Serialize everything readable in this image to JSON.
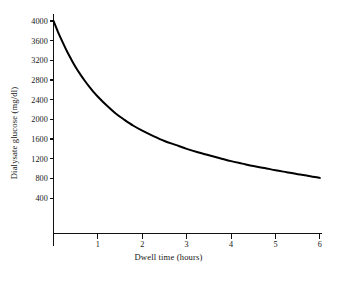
{
  "chart_data": {
    "type": "line",
    "title": "",
    "subtitle": "",
    "xlabel": "Dwell time (hours)",
    "ylabel": "Dialysate glucose (mg/dl)",
    "xlim": [
      0,
      6
    ],
    "ylim": [
      0,
      4100
    ],
    "xticks": [
      1,
      2,
      3,
      4,
      5,
      6
    ],
    "xtick_labels": [
      "1",
      "2",
      "3",
      "4",
      "5",
      "6"
    ],
    "yticks": [
      400,
      800,
      1200,
      1600,
      2000,
      2400,
      2800,
      3200,
      3600,
      4000
    ],
    "ytick_labels": [
      "400",
      "800",
      "1200",
      "1600",
      "2000",
      "2400",
      "2800",
      "3200",
      "3600",
      "4000"
    ],
    "grid": false,
    "legend": null,
    "annotations": [],
    "series": [
      {
        "name": "Dialysate glucose",
        "color": "#000000",
        "x": [
          0,
          0.1,
          0.2,
          0.3,
          0.4,
          0.5,
          0.6,
          0.7,
          0.8,
          0.9,
          1.0,
          1.2,
          1.4,
          1.6,
          1.8,
          2.0,
          2.25,
          2.5,
          2.75,
          3.0,
          3.25,
          3.5,
          3.75,
          4.0,
          4.25,
          4.5,
          4.75,
          5.0,
          5.25,
          5.5,
          5.75,
          6.0
        ],
        "y": [
          4000,
          3780,
          3580,
          3390,
          3220,
          3060,
          2920,
          2790,
          2670,
          2560,
          2460,
          2280,
          2120,
          1990,
          1870,
          1770,
          1660,
          1560,
          1480,
          1400,
          1330,
          1270,
          1210,
          1150,
          1100,
          1050,
          1010,
          965,
          925,
          885,
          850,
          810
        ]
      }
    ]
  },
  "axes": {
    "y_title": "Dialysate glucose (mg/dl)",
    "x_title": "Dwell time (hours)"
  }
}
